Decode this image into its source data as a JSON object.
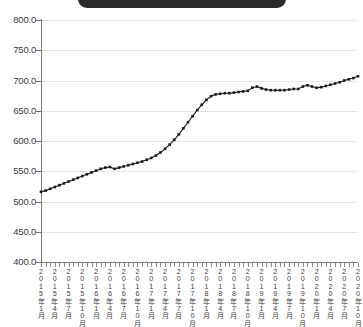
{
  "banner": {
    "label": "",
    "color": "#2b2b2b"
  },
  "chart_data": {
    "type": "line",
    "title": "",
    "xlabel": "",
    "ylabel": "",
    "ylim": [
      400.0,
      800.0
    ],
    "ytick_labels": [
      "800.0",
      "750.0",
      "700.0",
      "650.0",
      "600.0",
      "550.0",
      "500.0",
      "450.0",
      "400.0"
    ],
    "ytick_values": [
      800.0,
      750.0,
      700.0,
      650.0,
      600.0,
      550.0,
      500.0,
      450.0,
      400.0
    ],
    "grid": true,
    "legend": "none",
    "marker": "square",
    "line_color": "#1a1a1a",
    "categories": [
      "2015年1月",
      "2015年2月",
      "2015年3月",
      "2015年4月",
      "2015年5月",
      "2015年6月",
      "2015年7月",
      "2015年8月",
      "2015年9月",
      "2015年10月",
      "2015年11月",
      "2015年12月",
      "2016年1月",
      "2016年2月",
      "2016年3月",
      "2016年4月",
      "2016年5月",
      "2016年6月",
      "2016年7月",
      "2016年8月",
      "2016年9月",
      "2016年10月",
      "2016年11月",
      "2016年12月",
      "2017年1月",
      "2017年2月",
      "2017年3月",
      "2017年4月",
      "2017年5月",
      "2017年6月",
      "2017年7月",
      "2017年8月",
      "2017年9月",
      "2017年10月",
      "2017年11月",
      "2017年12月",
      "2018年1月",
      "2018年2月",
      "2018年3月",
      "2018年4月",
      "2018年5月",
      "2018年6月",
      "2018年7月",
      "2018年8月",
      "2018年9月",
      "2018年10月",
      "2018年11月",
      "2018年12月",
      "2019年1月",
      "2019年2月",
      "2019年3月",
      "2019年4月",
      "2019年5月",
      "2019年6月",
      "2019年7月",
      "2019年8月",
      "2019年9月",
      "2019年10月",
      "2019年11月",
      "2019年12月",
      "2020年1月",
      "2020年2月",
      "2020年3月",
      "2020年4月",
      "2020年5月",
      "2020年6月",
      "2020年7月",
      "2020年8月",
      "2020年9月",
      "2020年10月"
    ],
    "tick_labels_shown": [
      "2015年1月",
      "2015年4月",
      "2015年7月",
      "2015年10月",
      "2016年1月",
      "2016年4月",
      "2016年7月",
      "2016年10月",
      "2017年1月",
      "2017年4月",
      "2017年7月",
      "2017年10月",
      "2018年1月",
      "2018年4月",
      "2018年7月",
      "2018年10月",
      "2019年1月",
      "2019年4月",
      "2019年7月",
      "2019年10月",
      "2020年1月",
      "2020年4月",
      "2020年7月",
      "2020年10月"
    ],
    "values": [
      516,
      518,
      521,
      524,
      527,
      530,
      533,
      536,
      539,
      542,
      545,
      548,
      551,
      554,
      556,
      557,
      554,
      556,
      558,
      560,
      562,
      564,
      566,
      569,
      572,
      576,
      581,
      587,
      594,
      602,
      611,
      621,
      631,
      641,
      651,
      660,
      668,
      674,
      677,
      678,
      679,
      679,
      680,
      681,
      682,
      683,
      688,
      690,
      687,
      685,
      684,
      684,
      684,
      684,
      685,
      686,
      686,
      690,
      692,
      690,
      688,
      689,
      691,
      693,
      695,
      697,
      700,
      702,
      704,
      707
    ]
  }
}
